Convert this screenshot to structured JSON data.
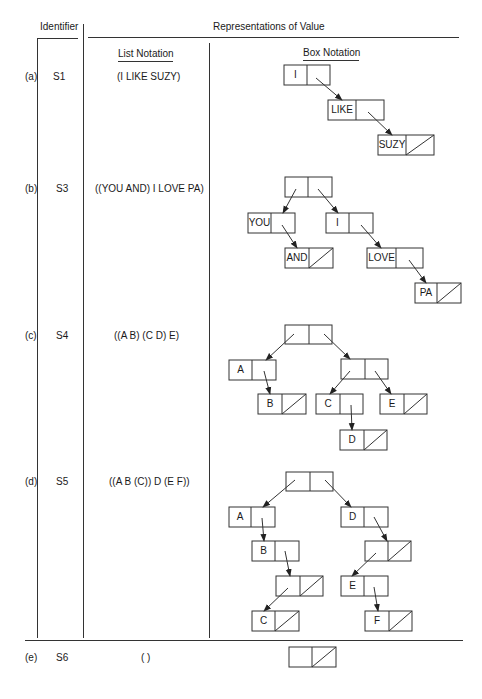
{
  "header": {
    "identifier": "Identifier",
    "representations": "Representations of Value",
    "list_notation": "List Notation",
    "box_notation": "Box Notation"
  },
  "rows": [
    {
      "label": "(a)",
      "id": "S1",
      "list": "(I LIKE SUZY)"
    },
    {
      "label": "(b)",
      "id": "S3",
      "list": "((YOU AND) I LOVE PA)"
    },
    {
      "label": "(c)",
      "id": "S4",
      "list": "((A B) (C D) E)"
    },
    {
      "label": "(d)",
      "id": "S5",
      "list": "((A B (C)) D (E F))"
    },
    {
      "label": "(e)",
      "id": "S6",
      "list": "( )"
    }
  ],
  "boxes": {
    "a": [
      "I",
      "LIKE",
      "SUZY"
    ],
    "b": [
      "YOU",
      "AND",
      "I",
      "LOVE",
      "PA"
    ],
    "c": [
      "A",
      "B",
      "C",
      "D",
      "E"
    ],
    "d": [
      "A",
      "B",
      "C",
      "D",
      "E",
      "F"
    ]
  },
  "colors": {
    "line": "#333333",
    "background": "#ffffff"
  }
}
